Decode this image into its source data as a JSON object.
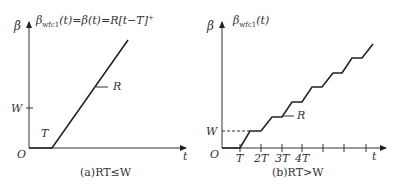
{
  "figure_a": {
    "title_main": "β",
    "title_sub": "wfc1",
    "title_rest": "(t)=β(t)=R[t−T]",
    "title_sup": "+",
    "y_axis_label": "β",
    "x_axis_label": "t",
    "origin_label": "O",
    "w_label": "W",
    "t_label": "T",
    "rate_label": "R",
    "caption": "(a)RT≤W"
  },
  "figure_b": {
    "title_main": "β",
    "title_sub": "wfc1",
    "title_rest": "(t)",
    "y_axis_label": "β",
    "x_axis_label": "t",
    "origin_label": "O",
    "w_label": "W",
    "rate_label": "R",
    "tick_labels": [
      "T",
      "2T",
      "3T",
      "4T"
    ],
    "caption": "(b)RT>W"
  },
  "colors": {
    "line": "#222222",
    "text": "#333333",
    "background": "#ffffff"
  }
}
